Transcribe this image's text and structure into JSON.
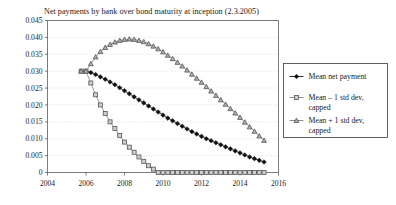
{
  "chart_data": {
    "type": "line",
    "title": "Net payments by bank over bond maturity at inception (2.3.2005)",
    "xlabel": "",
    "ylabel": "",
    "xlim": [
      2004,
      2016
    ],
    "ylim": [
      0,
      0.045
    ],
    "grid": true,
    "legend_position": "right",
    "x_ticks": [
      "2004",
      "2006",
      "2008",
      "2010",
      "2012",
      "2014",
      "2016"
    ],
    "x_tick_values": [
      2004,
      2006,
      2008,
      2010,
      2012,
      2014,
      2016
    ],
    "y_ticks": [
      "0",
      "0.005",
      "0.010",
      "0.015",
      "0.020",
      "0.025",
      "0.030",
      "0.035",
      "0.040",
      "0.045"
    ],
    "y_tick_values": [
      0,
      0.005,
      0.01,
      0.015,
      0.02,
      0.025,
      0.03,
      0.035,
      0.04,
      0.045
    ],
    "x": [
      2005.75,
      2006.0,
      2006.25,
      2006.5,
      2006.75,
      2007.0,
      2007.25,
      2007.5,
      2007.75,
      2008.0,
      2008.25,
      2008.5,
      2008.75,
      2009.0,
      2009.25,
      2009.5,
      2009.75,
      2010.0,
      2010.25,
      2010.5,
      2010.75,
      2011.0,
      2011.25,
      2011.5,
      2011.75,
      2012.0,
      2012.25,
      2012.5,
      2012.75,
      2013.0,
      2013.25,
      2013.5,
      2013.75,
      2014.0,
      2014.25,
      2014.5,
      2014.75,
      2015.0,
      2015.25
    ],
    "series": [
      {
        "name": "Mean net payment",
        "marker": "diamond",
        "color": "#1a1a1a",
        "values": [
          0.03,
          0.03,
          0.0296,
          0.029,
          0.0283,
          0.0276,
          0.0268,
          0.026,
          0.0251,
          0.0242,
          0.0233,
          0.0224,
          0.0215,
          0.0206,
          0.0197,
          0.0188,
          0.0179,
          0.017,
          0.0161,
          0.0153,
          0.0145,
          0.0137,
          0.0129,
          0.0121,
          0.0114,
          0.0107,
          0.01,
          0.0094,
          0.0088,
          0.0082,
          0.0076,
          0.007,
          0.0064,
          0.0058,
          0.0052,
          0.0046,
          0.0041,
          0.0036,
          0.0031
        ]
      },
      {
        "name": "Mean – 1 std dev, capped",
        "marker": "square",
        "color": "#808080",
        "values": [
          0.03,
          0.03,
          0.0265,
          0.023,
          0.02,
          0.0175,
          0.015,
          0.013,
          0.011,
          0.009,
          0.0075,
          0.006,
          0.0046,
          0.0033,
          0.002,
          0.001,
          0.0,
          0.0,
          0.0,
          0.0,
          0.0,
          0.0,
          0.0,
          0.0,
          0.0,
          0.0,
          0.0,
          0.0,
          0.0,
          0.0,
          0.0,
          0.0,
          0.0,
          0.0,
          0.0,
          0.0,
          0.0,
          0.0,
          0.0
        ]
      },
      {
        "name": "Mean + 1 std dev, capped",
        "marker": "triangle",
        "color": "#808080",
        "values": [
          0.03,
          0.03,
          0.0322,
          0.0342,
          0.0358,
          0.037,
          0.0379,
          0.0386,
          0.0391,
          0.0394,
          0.0395,
          0.0394,
          0.0391,
          0.0387,
          0.0381,
          0.0374,
          0.0366,
          0.0357,
          0.0347,
          0.0337,
          0.0326,
          0.0315,
          0.0303,
          0.0291,
          0.0279,
          0.0267,
          0.0254,
          0.0241,
          0.0228,
          0.0215,
          0.0202,
          0.0189,
          0.0176,
          0.0163,
          0.0149,
          0.0135,
          0.0122,
          0.0108,
          0.0095
        ]
      }
    ],
    "legend_entries": [
      {
        "label_line1": "Mean net payment",
        "label_line2": "",
        "marker": "diamond"
      },
      {
        "label_line1": "Mean – 1 std dev,",
        "label_line2": "capped",
        "marker": "square"
      },
      {
        "label_line1": "Mean + 1 std dev,",
        "label_line2": "capped",
        "marker": "triangle"
      }
    ]
  }
}
